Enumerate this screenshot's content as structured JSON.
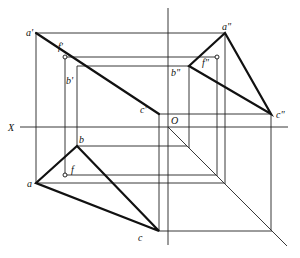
{
  "diagram": {
    "axis_labels": {
      "x_axis": "X",
      "origin": "O"
    },
    "labels": {
      "a_front": "a'",
      "b_front": "b'",
      "c_front": "c'",
      "f_front": "f'",
      "a_side": "a\"",
      "b_side": "b\"",
      "c_side": "c\"",
      "f_side": "f\"",
      "a_top": "a",
      "b_top": "b",
      "c_top": "c",
      "f_top": "f"
    }
  }
}
